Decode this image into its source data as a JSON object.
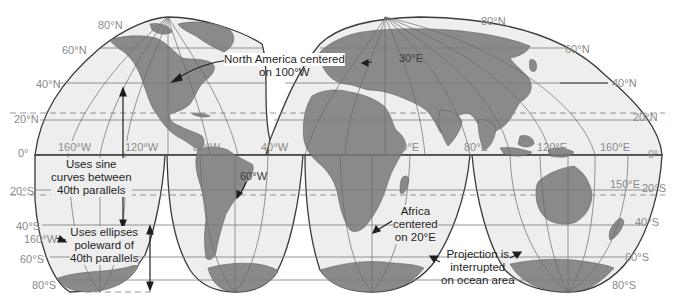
{
  "map": {
    "projection": "Goode's Interrupted Homolosine",
    "colors": {
      "ocean": "#eeeeee",
      "land": "#8a8a8a",
      "outline": "#3a3a3a",
      "grid": "#7a7a7a",
      "label": "#8a8a8a",
      "annotation": "#1e1e1e",
      "background": "#ffffff"
    },
    "latitude_labels": {
      "left": [
        "80°N",
        "60°N",
        "40°N",
        "20°N",
        "0°",
        "20°S",
        "40°S",
        "60°S",
        "80°S"
      ],
      "right": [
        "80°N",
        "60°N",
        "40°N",
        "20°N",
        "0°",
        "20°S",
        "40°S",
        "60°S",
        "80°S"
      ]
    },
    "longitude_labels": [
      "160°W",
      "120°W",
      "80°W",
      "40°W",
      "0°",
      "40°E",
      "80°E",
      "120°E",
      "160°E"
    ],
    "extra_labels": {
      "sixty_w": "60°W",
      "thirty_e": "30°E",
      "one_fifty_e": "150°E",
      "one_sixty_w_south": "160°W"
    },
    "annotations": {
      "north_america": [
        "North America centered",
        "on 100°W"
      ],
      "sine": [
        "Uses sine",
        "curves between",
        "40th parallels"
      ],
      "ellipses": [
        "Uses ellipses",
        "poleward of",
        "40th parallels"
      ],
      "africa": [
        "Africa",
        "centered",
        "on 20°E"
      ],
      "interrupted": [
        "Projection is",
        "interrupted",
        "on ocean area"
      ]
    }
  }
}
